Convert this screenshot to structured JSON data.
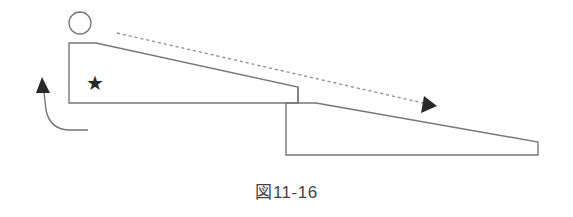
{
  "figure": {
    "caption": "図11-16"
  },
  "colors": {
    "line": "#777777",
    "fill_dark": "#2a2a2a",
    "dashed": "#8a8a8a",
    "text": "#444444"
  },
  "elements": {
    "person_head": "circle",
    "upper_slope": "trapezoid slope (upper level)",
    "lower_slope": "trapezoid slope (lower level)",
    "star_marker": "★",
    "dashed_arrow": "downslope direction arrow",
    "curved_arrow": "upward return arrow"
  }
}
